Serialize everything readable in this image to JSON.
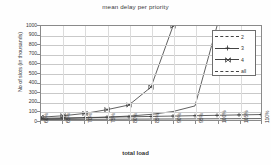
{
  "chart_data": {
    "type": "line",
    "title": "mean delay per priority",
    "xlabel": "total load",
    "ylabel": "No of slots (in thousands)",
    "x": [
      "60%",
      "65%",
      "70%",
      "75%",
      "80%",
      "85%",
      "90%",
      "95%",
      "100%",
      "105%",
      "110%"
    ],
    "xlim": [
      60,
      110
    ],
    "ylim": [
      0,
      1000
    ],
    "yticks": [
      0,
      100,
      200,
      300,
      400,
      500,
      600,
      700,
      800,
      900,
      1000
    ],
    "grid": true,
    "legend_position": "top-right",
    "series": [
      {
        "name": "2",
        "marker": "none",
        "values": [
          5,
          6,
          7,
          8,
          9,
          10,
          11,
          12,
          13,
          14,
          15
        ]
      },
      {
        "name": "3",
        "marker": "plus",
        "values": [
          18,
          22,
          26,
          30,
          34,
          38,
          42,
          46,
          50,
          54,
          58
        ]
      },
      {
        "name": "4",
        "marker": "bowtie",
        "values": [
          30,
          45,
          70,
          110,
          160,
          350,
          1000,
          null,
          null,
          null,
          null
        ]
      },
      {
        "name": "all",
        "marker": "none",
        "values": [
          12,
          16,
          22,
          30,
          42,
          60,
          90,
          150,
          1000,
          null,
          null
        ]
      }
    ]
  },
  "legend": {
    "items": [
      {
        "label": "2"
      },
      {
        "label": "3"
      },
      {
        "label": "4"
      },
      {
        "label": "all"
      }
    ]
  },
  "yticks": {
    "t0": "1000",
    "t1": "900",
    "t2": "800",
    "t3": "700",
    "t4": "600",
    "t5": "500",
    "t6": "400",
    "t7": "300",
    "t8": "200",
    "t9": "100",
    "t10": "0"
  },
  "xticks": {
    "t0": "60%",
    "t1": "65%",
    "t2": "70%",
    "t3": "75%",
    "t4": "80%",
    "t5": "85%",
    "t6": "90%",
    "t7": "95%",
    "t8": "100%",
    "t9": "105%",
    "t10": "110%"
  },
  "colors": {
    "line": "#444444",
    "grid": "#c9c9c9",
    "frame": "#8a8a8a",
    "text": "#333333"
  }
}
